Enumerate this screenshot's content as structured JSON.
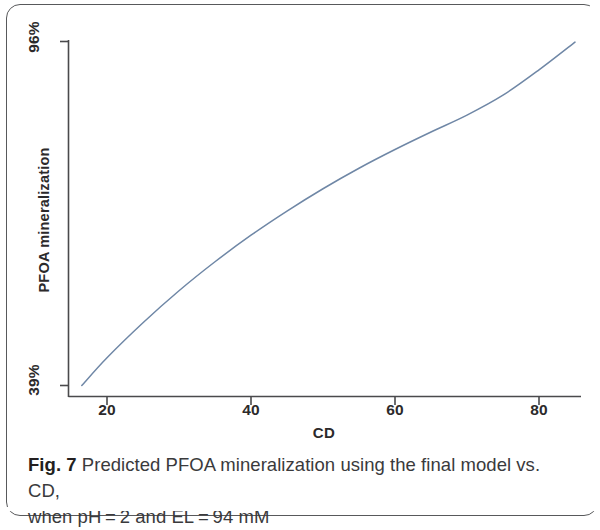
{
  "figure": {
    "caption_label": "Fig. 7",
    "caption_line1": "Predicted PFOA mineralization using the final model vs. CD,",
    "caption_line2": "when pH = 2 and EL = 94 mM"
  },
  "chart_data": {
    "type": "line",
    "title": "",
    "subtitle": "",
    "xlabel": "CD",
    "ylabel": "PFOA mineralization",
    "xlim": [
      13,
      88
    ],
    "ylim": [
      39,
      96
    ],
    "xticks": [
      20,
      40,
      60,
      80
    ],
    "xticklabels": [
      "20",
      "40",
      "60",
      "80"
    ],
    "yticks": [
      39,
      96
    ],
    "yticklabels": [
      "39%",
      "96%"
    ],
    "grid": false,
    "legend": null,
    "line_color": "#6f87a6",
    "series": [
      {
        "name": "Predicted PFOA mineralization",
        "x": [
          16.5,
          20,
          25,
          30,
          35,
          40,
          45,
          50,
          55,
          60,
          65,
          70,
          75,
          80,
          85
        ],
        "y": [
          39.0,
          43.6,
          49.4,
          54.7,
          59.5,
          63.9,
          67.9,
          71.6,
          75.0,
          78.1,
          81.0,
          83.8,
          87.1,
          91.3,
          95.9
        ]
      }
    ],
    "annotations": []
  },
  "axes": {
    "x_tick_0": "20",
    "x_tick_1": "40",
    "x_tick_2": "60",
    "x_tick_3": "80",
    "y_tick_top": "96%",
    "y_tick_bottom": "39%",
    "x_title": "CD",
    "y_title": "PFOA mineralization"
  }
}
